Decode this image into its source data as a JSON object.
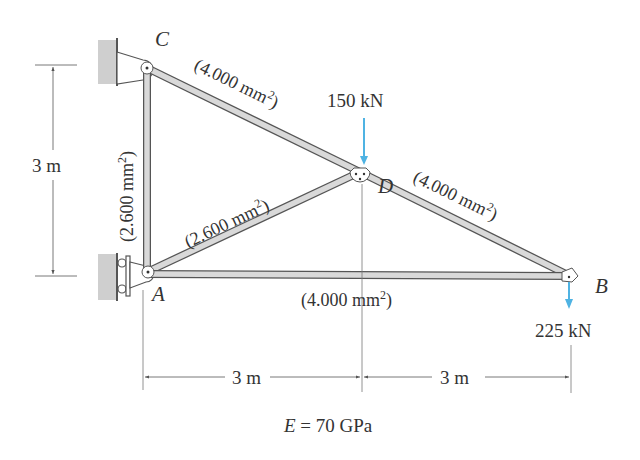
{
  "figure": {
    "nodes": {
      "A": {
        "label": "A"
      },
      "B": {
        "label": "B"
      },
      "C": {
        "label": "C"
      },
      "D": {
        "label": "D"
      }
    },
    "members": {
      "CD": {
        "area_label": "(4.000 mm",
        "sup": "2",
        "close": ")"
      },
      "DB": {
        "area_label": "(4.000 mm",
        "sup": "2",
        "close": ")"
      },
      "AD": {
        "area_label": "(2.600 mm",
        "sup": "2",
        "close": ")"
      },
      "AC": {
        "area_label": "(2.600 mm",
        "sup": "2",
        "close": ")"
      },
      "AB": {
        "area_label": "(4.000 mm",
        "sup": "2",
        "close": ")"
      }
    },
    "loads": {
      "at_D": {
        "label": "150 kN",
        "direction": "down"
      },
      "at_B": {
        "label": "225 kN",
        "direction": "down"
      }
    },
    "dimensions": {
      "vertical": {
        "label": "3 m"
      },
      "horizontal_left": {
        "label": "3 m"
      },
      "horizontal_right": {
        "label": "3 m"
      }
    },
    "material": {
      "symbol": "E",
      "equals": " = 70 GPa"
    },
    "colors": {
      "load_arrow": "#4fb3e3",
      "member_fill": "#d9d9d9",
      "member_edge": "#555555",
      "wall": "#cfcfcf",
      "text": "#333333"
    }
  }
}
